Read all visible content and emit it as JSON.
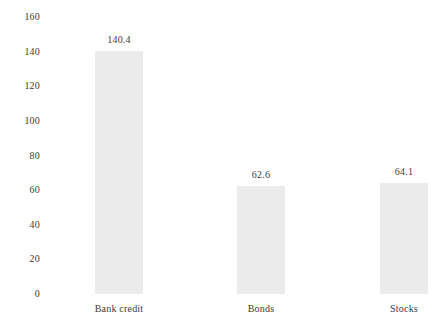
{
  "chart_data": {
    "type": "bar",
    "title": "",
    "subtitle": "",
    "xlabel": "",
    "ylabel": "",
    "categories": [
      "Bank credit",
      "Bonds",
      "Stocks"
    ],
    "values": [
      140.4,
      62.6,
      64.1
    ],
    "value_labels": [
      "140.4",
      "62.6",
      "64.1"
    ],
    "ylim": [
      0,
      160
    ],
    "ytick_labels": [
      "160",
      "140",
      "120",
      "100",
      "80",
      "60",
      "40",
      "20",
      "0"
    ],
    "ytick_values": [
      160,
      140,
      120,
      100,
      80,
      60,
      40,
      20,
      0
    ],
    "grid": false,
    "legend": false,
    "legend_position": "none",
    "bar_color": "#ebebeb",
    "text_color": "#3c3c3c",
    "background_color": "#ffffff"
  },
  "axis": {
    "y": {
      "ticks": [
        {
          "label": "160",
          "value": 160
        },
        {
          "label": "140",
          "value": 140
        },
        {
          "label": "120",
          "value": 120
        },
        {
          "label": "100",
          "value": 100
        },
        {
          "label": "80",
          "value": 80
        },
        {
          "label": "60",
          "value": 60
        },
        {
          "label": "40",
          "value": 40
        },
        {
          "label": "20",
          "value": 20
        },
        {
          "label": "0",
          "value": 0
        }
      ]
    }
  },
  "bars": [
    {
      "category": "Bank credit",
      "value": 140.4,
      "value_label": "140.4"
    },
    {
      "category": "Bonds",
      "value": 62.6,
      "value_label": "62.6"
    },
    {
      "category": "Stocks",
      "value": 64.1,
      "value_label": "64.1"
    }
  ]
}
